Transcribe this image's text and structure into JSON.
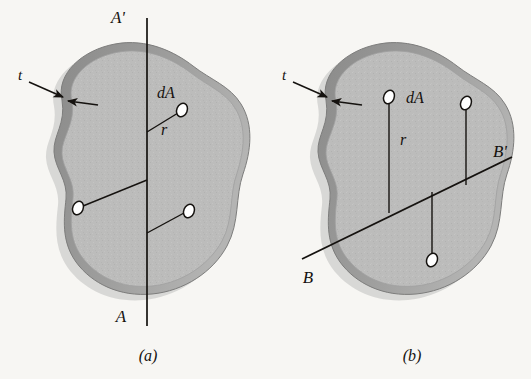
{
  "figure": {
    "background_color": "#f7f6f3",
    "ink_color": "#15120f",
    "plate_fill_color": "#b9b9b9",
    "plate_rim_color": "#8d8d8d",
    "plate_shadow_color": "#cfcfcd",
    "element_fill_color": "#ffffff"
  },
  "panels": [
    {
      "id": "panel-a",
      "caption": "(a)",
      "axis_name": "A-A'",
      "axis_orientation": "vertical",
      "axis_top_label": "A'",
      "axis_bottom_label": "A",
      "thickness_label": "t",
      "element_label": "dA",
      "radius_label": "r",
      "element_count": 3,
      "elements": [
        {
          "name": "upper-right-element",
          "label": "dA",
          "radius_label": "r"
        },
        {
          "name": "mid-left-element",
          "label": "",
          "radius_label": ""
        },
        {
          "name": "lower-right-element",
          "label": "",
          "radius_label": ""
        }
      ]
    },
    {
      "id": "panel-b",
      "caption": "(b)",
      "axis_name": "B-B'",
      "axis_orientation": "oblique",
      "axis_top_label": "B'",
      "axis_bottom_label": "B",
      "thickness_label": "t",
      "element_label": "dA",
      "radius_label": "r",
      "element_count": 3,
      "elements": [
        {
          "name": "upper-left-element",
          "label": "dA",
          "radius_label": "r"
        },
        {
          "name": "upper-right-element",
          "label": "",
          "radius_label": ""
        },
        {
          "name": "lower-middle-element",
          "label": "",
          "radius_label": ""
        }
      ]
    }
  ]
}
